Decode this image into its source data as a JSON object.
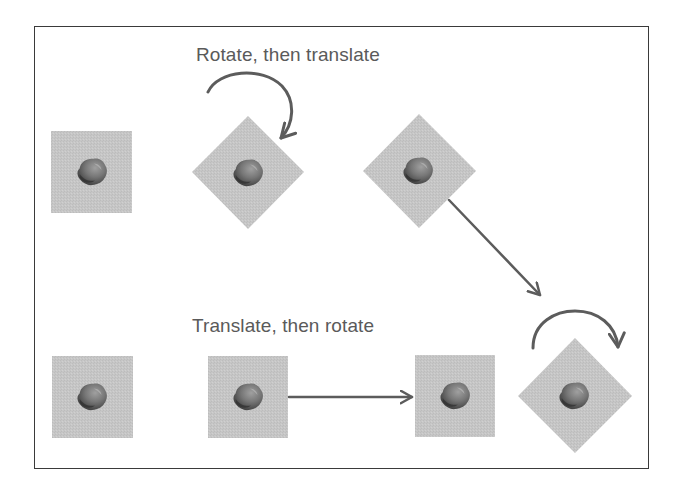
{
  "diagram": {
    "title_top": "Rotate, then translate",
    "title_bottom": "Translate, then rotate",
    "colors": {
      "border": "#3a3a3a",
      "tile": "#c6c6c6",
      "arrow": "#5c5c5c",
      "text": "#5a5a5a",
      "rock_dark": "#3c3c3c",
      "rock_mid": "#6e6e6e",
      "rock_light": "#9a9a9a"
    },
    "rows": [
      {
        "name": "rotate-then-translate",
        "steps": [
          {
            "state": "original",
            "shape": "square",
            "center": [
              92,
              172
            ]
          },
          {
            "state": "rotated-45",
            "shape": "diamond",
            "center": [
              248,
              172
            ]
          },
          {
            "state": "rotated-and-translated",
            "shape": "diamond",
            "center": [
              419,
              171
            ]
          }
        ],
        "arrows": [
          {
            "type": "curved-rotate",
            "from": "original",
            "to": "rotated-45"
          },
          {
            "type": "straight-translate",
            "from": "rotated-45",
            "to": "bottom-row-final",
            "direction": "down-right"
          }
        ]
      },
      {
        "name": "translate-then-rotate",
        "steps": [
          {
            "state": "original",
            "shape": "square",
            "center": [
              92,
              397
            ]
          },
          {
            "state": "original-copy",
            "shape": "square",
            "center": [
              248,
              397
            ]
          },
          {
            "state": "translated",
            "shape": "square",
            "center": [
              455,
              396
            ]
          },
          {
            "state": "translated-and-rotated",
            "shape": "diamond",
            "center": [
              575,
              396
            ]
          }
        ],
        "arrows": [
          {
            "type": "straight-translate",
            "direction": "right"
          },
          {
            "type": "curved-rotate",
            "direction": "clockwise"
          }
        ]
      }
    ]
  }
}
